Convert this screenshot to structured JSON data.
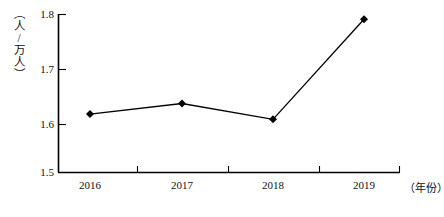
{
  "chart_data": {
    "type": "line",
    "title": "",
    "subtitle": "",
    "xlabel": "（年份）",
    "ylabel": "（人/万人）",
    "categories": [
      "2016",
      "2017",
      "2018",
      "2019"
    ],
    "x": [
      2016,
      2017,
      2018,
      2019
    ],
    "values": [
      1.61,
      1.63,
      1.6,
      1.79
    ],
    "series": [
      {
        "name": "",
        "values": [
          1.61,
          1.63,
          1.6,
          1.79
        ]
      }
    ],
    "ylim": [
      1.5,
      1.8
    ],
    "yticks": [
      "1.5",
      "1.6",
      "1.7",
      "1.8"
    ],
    "ytick_values": [
      1.5,
      1.6,
      1.7,
      1.8
    ],
    "xticks": [
      "2016",
      "2017",
      "2018",
      "2019"
    ],
    "grid": false,
    "legend": false,
    "legend_position": "none",
    "marker": "diamond",
    "line_color": "#000000",
    "marker_color": "#000000",
    "axis_color": "#000000",
    "background_color": "#ffffff"
  },
  "axes": {
    "y_unit": "（人/万人）",
    "x_unit": "（年份）",
    "y_labels": [
      "1.8",
      "1.7",
      "1.6",
      "1.5"
    ],
    "x_labels": [
      "2016",
      "2017",
      "2018",
      "2019"
    ]
  }
}
